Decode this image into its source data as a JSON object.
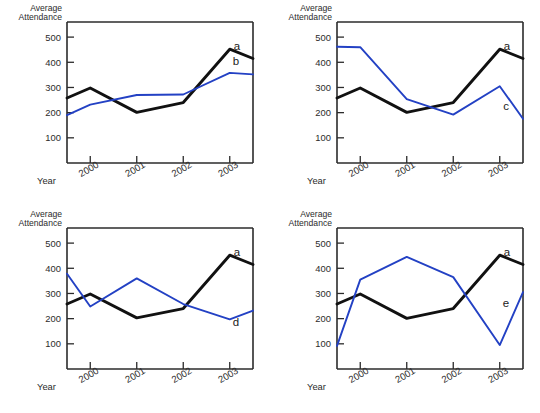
{
  "figure": {
    "panel_count": 4,
    "background_color": "#ffffff"
  },
  "axes": {
    "ylabel_line1": "Average",
    "ylabel_line2": "Attendance",
    "xlabel": "Year",
    "yticks": [
      "500",
      "400",
      "300",
      "200",
      "100"
    ],
    "xticks": [
      "2000",
      "2001",
      "2002",
      "2003"
    ]
  },
  "colors": {
    "series_a": "#111111",
    "series_blue": "#2341c4",
    "axis": "#2b2b2b"
  },
  "chart_data": [
    {
      "type": "line",
      "panel": "top-left",
      "title": "",
      "xlabel": "Year",
      "ylabel": "Average Attendance",
      "categories": [
        "2000",
        "2001",
        "2002",
        "2003"
      ],
      "xlim": [
        1999.5,
        2003.5
      ],
      "ylim": [
        0,
        560
      ],
      "yticks": [
        100,
        200,
        300,
        400,
        500
      ],
      "grid": false,
      "legend": "inline-labels",
      "series": [
        {
          "name": "a",
          "color": "#111111",
          "x": [
            1999.5,
            2000,
            2001,
            2002,
            2003,
            2003.5
          ],
          "values": [
            258,
            298,
            201,
            240,
            452,
            415
          ]
        },
        {
          "name": "b",
          "color": "#2341c4",
          "x": [
            1999.5,
            2000,
            2001,
            2002,
            2003,
            2003.5
          ],
          "values": [
            190,
            232,
            270,
            272,
            358,
            352
          ]
        }
      ]
    },
    {
      "type": "line",
      "panel": "top-right",
      "title": "",
      "xlabel": "Year",
      "ylabel": "Average Attendance",
      "categories": [
        "2000",
        "2001",
        "2002",
        "2003"
      ],
      "xlim": [
        1999.5,
        2003.5
      ],
      "ylim": [
        0,
        560
      ],
      "yticks": [
        100,
        200,
        300,
        400,
        500
      ],
      "grid": false,
      "legend": "inline-labels",
      "series": [
        {
          "name": "a",
          "color": "#111111",
          "x": [
            1999.5,
            2000,
            2001,
            2002,
            2003,
            2003.5
          ],
          "values": [
            258,
            298,
            201,
            240,
            452,
            415
          ]
        },
        {
          "name": "c",
          "color": "#2341c4",
          "x": [
            1999.5,
            2000,
            2001,
            2002,
            2003,
            2003.5
          ],
          "values": [
            462,
            460,
            254,
            192,
            305,
            176
          ]
        }
      ]
    },
    {
      "type": "line",
      "panel": "bottom-left",
      "title": "",
      "xlabel": "Year",
      "ylabel": "Average Attendance",
      "categories": [
        "2000",
        "2001",
        "2002",
        "2003"
      ],
      "xlim": [
        1999.5,
        2003.5
      ],
      "ylim": [
        0,
        560
      ],
      "yticks": [
        100,
        200,
        300,
        400,
        500
      ],
      "grid": false,
      "legend": "inline-labels",
      "series": [
        {
          "name": "a",
          "color": "#111111",
          "x": [
            1999.5,
            2000,
            2001,
            2002,
            2003,
            2003.5
          ],
          "values": [
            258,
            298,
            203,
            240,
            452,
            415
          ]
        },
        {
          "name": "d",
          "color": "#2341c4",
          "x": [
            1999.5,
            2000,
            2001,
            2002,
            2003,
            2003.5
          ],
          "values": [
            378,
            248,
            360,
            258,
            197,
            232
          ]
        }
      ]
    },
    {
      "type": "line",
      "panel": "bottom-right",
      "title": "",
      "xlabel": "Year",
      "ylabel": "Average Attendance",
      "categories": [
        "2000",
        "2001",
        "2002",
        "2003"
      ],
      "xlim": [
        1999.5,
        2003.5
      ],
      "ylim": [
        0,
        560
      ],
      "yticks": [
        100,
        200,
        300,
        400,
        500
      ],
      "grid": false,
      "legend": "inline-labels",
      "series": [
        {
          "name": "a",
          "color": "#111111",
          "x": [
            1999.5,
            2000,
            2001,
            2002,
            2003,
            2003.5
          ],
          "values": [
            258,
            298,
            201,
            240,
            452,
            415
          ]
        },
        {
          "name": "e",
          "color": "#2341c4",
          "x": [
            1999.5,
            2000,
            2001,
            2002,
            2003,
            2003.5
          ],
          "values": [
            92,
            355,
            445,
            365,
            95,
            305
          ]
        }
      ]
    }
  ]
}
